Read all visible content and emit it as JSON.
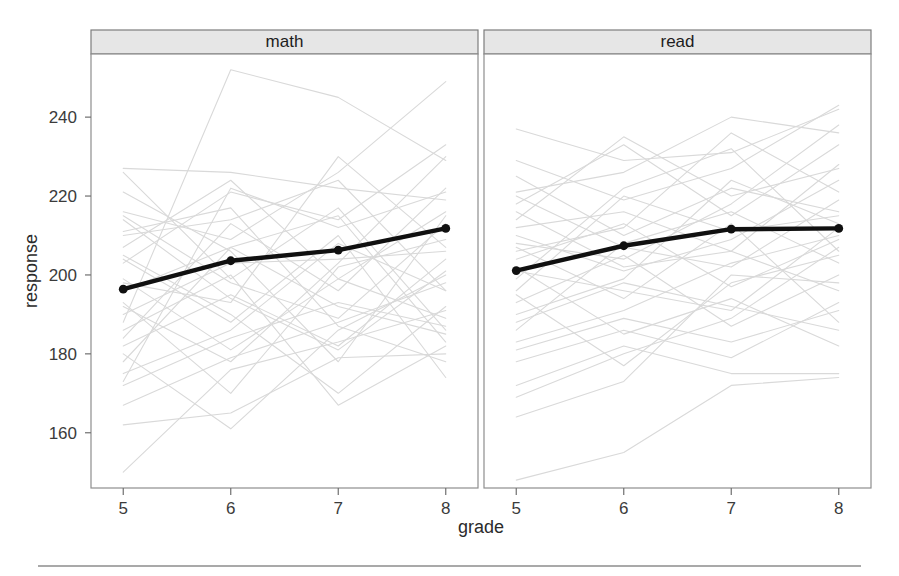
{
  "figure": {
    "background": "#ffffff",
    "mean_color": "#101010",
    "spaghetti_color": "#d9d9d9",
    "strip_fill": "#e6e6e6",
    "frame_color": "#8e8e8e"
  },
  "axes": {
    "xlabel": "grade",
    "ylabel": "response",
    "xticks": [
      5,
      6,
      7,
      8
    ],
    "yticks": [
      160,
      180,
      200,
      220,
      240
    ],
    "xlim": [
      4.7,
      8.3
    ],
    "ylim": [
      146,
      256
    ]
  },
  "panels": [
    {
      "label": "math"
    },
    {
      "label": "read"
    }
  ],
  "chart_data": {
    "type": "line",
    "title": "",
    "xlabel": "grade",
    "ylabel": "response",
    "xlim": [
      4.7,
      8.3
    ],
    "ylim": [
      146,
      256
    ],
    "xticks": [
      5,
      6,
      7,
      8
    ],
    "yticks": [
      160,
      180,
      200,
      220,
      240
    ],
    "grid": false,
    "legend": "none",
    "panel_variable": "subject",
    "panels": [
      "math",
      "read"
    ],
    "x": [
      5,
      6,
      7,
      8
    ],
    "series": [
      {
        "name": "math mean",
        "panel": "math",
        "emphasis": "mean",
        "values": [
          196.4,
          203.6,
          206.3,
          211.8
        ]
      },
      {
        "name": "read mean",
        "panel": "read",
        "emphasis": "mean",
        "values": [
          201.1,
          207.4,
          211.6,
          211.8
        ]
      }
    ],
    "individual_trajectories": {
      "math": [
        [
          203.0,
          221.0,
          214.0,
          233.0
        ],
        [
          227.0,
          226.0,
          222.0,
          219.0
        ],
        [
          188.0,
          252.0,
          245.0,
          229.0
        ],
        [
          216.0,
          209.0,
          226.0,
          249.0
        ],
        [
          173.0,
          222.0,
          212.0,
          221.0
        ],
        [
          192.0,
          178.0,
          203.0,
          230.0
        ],
        [
          221.0,
          206.0,
          178.0,
          215.0
        ],
        [
          210.0,
          214.0,
          224.0,
          196.0
        ],
        [
          184.0,
          213.0,
          196.0,
          222.0
        ],
        [
          198.0,
          193.0,
          230.0,
          207.0
        ],
        [
          207.0,
          224.0,
          199.0,
          189.0
        ],
        [
          180.0,
          161.0,
          186.0,
          200.0
        ],
        [
          215.0,
          198.0,
          189.0,
          213.0
        ],
        [
          196.0,
          207.0,
          215.0,
          183.0
        ],
        [
          175.0,
          186.0,
          208.0,
          196.0
        ],
        [
          205.0,
          190.0,
          170.0,
          192.0
        ],
        [
          190.0,
          203.0,
          204.0,
          206.0
        ],
        [
          226.0,
          199.0,
          217.0,
          186.0
        ],
        [
          182.0,
          195.0,
          182.0,
          204.0
        ],
        [
          172.0,
          184.0,
          193.0,
          187.0
        ],
        [
          199.0,
          181.0,
          199.0,
          216.0
        ],
        [
          211.0,
          217.0,
          187.0,
          178.0
        ],
        [
          186.0,
          200.0,
          167.0,
          182.0
        ],
        [
          167.0,
          179.0,
          188.0,
          198.0
        ],
        [
          193.0,
          170.0,
          202.0,
          209.0
        ],
        [
          204.0,
          188.0,
          210.0,
          174.0
        ],
        [
          178.0,
          207.0,
          192.0,
          185.0
        ],
        [
          150.0,
          176.0,
          183.0,
          191.0
        ],
        [
          162.0,
          165.0,
          179.0,
          180.0
        ],
        [
          214.0,
          194.0,
          181.0,
          201.0
        ]
      ],
      "read": [
        [
          237.0,
          229.0,
          231.0,
          242.0
        ],
        [
          221.0,
          226.0,
          240.0,
          236.0
        ],
        [
          214.0,
          235.0,
          220.0,
          227.0
        ],
        [
          229.0,
          219.0,
          227.0,
          243.0
        ],
        [
          206.0,
          212.0,
          236.0,
          221.0
        ],
        [
          218.0,
          233.0,
          215.0,
          233.0
        ],
        [
          225.0,
          210.0,
          222.0,
          216.0
        ],
        [
          199.0,
          222.0,
          232.0,
          206.0
        ],
        [
          212.0,
          216.0,
          206.0,
          228.0
        ],
        [
          208.0,
          204.0,
          218.0,
          238.0
        ],
        [
          196.0,
          220.0,
          211.0,
          215.0
        ],
        [
          220.0,
          207.0,
          202.0,
          219.0
        ],
        [
          190.0,
          199.0,
          224.0,
          213.0
        ],
        [
          204.0,
          213.0,
          197.0,
          209.0
        ],
        [
          210.0,
          201.0,
          209.0,
          224.0
        ],
        [
          186.0,
          208.0,
          216.0,
          203.0
        ],
        [
          201.0,
          196.0,
          191.0,
          212.0
        ],
        [
          216.0,
          202.0,
          206.0,
          196.0
        ],
        [
          183.0,
          191.0,
          203.0,
          210.0
        ],
        [
          193.0,
          205.0,
          187.0,
          200.0
        ],
        [
          178.0,
          186.0,
          179.0,
          193.0
        ],
        [
          207.0,
          194.0,
          213.0,
          188.0
        ],
        [
          172.0,
          182.0,
          175.0,
          175.0
        ],
        [
          195.0,
          177.0,
          198.0,
          205.0
        ],
        [
          188.0,
          198.0,
          192.0,
          186.0
        ],
        [
          164.0,
          173.0,
          200.0,
          198.0
        ],
        [
          181.0,
          189.0,
          183.0,
          191.0
        ],
        [
          148.0,
          155.0,
          172.0,
          174.0
        ],
        [
          202.0,
          185.0,
          194.0,
          182.0
        ],
        [
          169.0,
          180.0,
          189.0,
          207.0
        ]
      ]
    }
  }
}
